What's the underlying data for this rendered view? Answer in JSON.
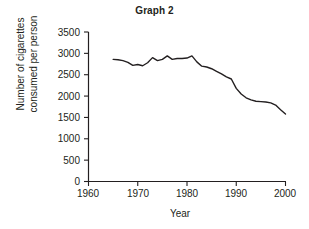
{
  "chart_data": {
    "type": "line",
    "title": "Graph 2",
    "xlabel": "Year",
    "ylabel": "Number of cigarettes consumed per person",
    "ylabel_lines": [
      "Number of cigarettes",
      "consumed per person"
    ],
    "xlim": [
      1960,
      2000
    ],
    "ylim": [
      0,
      3500
    ],
    "xticks": [
      1960,
      1970,
      1980,
      1990,
      2000
    ],
    "xtick_labels": [
      "1960",
      "1970",
      "1980",
      "1990",
      "2000"
    ],
    "yticks": [
      0,
      500,
      1000,
      1500,
      2000,
      2500,
      3000,
      3500
    ],
    "ytick_labels": [
      "0",
      "500",
      "1000",
      "1500",
      "2000",
      "2500",
      "3000",
      "3500"
    ],
    "grid": false,
    "legend": false,
    "line_color": "#231f20",
    "line_width": 1.4,
    "series": [
      {
        "name": "Cigarettes consumed per person",
        "x": [
          1965,
          1966,
          1967,
          1968,
          1969,
          1970,
          1971,
          1972,
          1973,
          1974,
          1975,
          1976,
          1977,
          1978,
          1979,
          1980,
          1981,
          1982,
          1983,
          1984,
          1985,
          1986,
          1987,
          1988,
          1989,
          1990,
          1991,
          1992,
          1993,
          1994,
          1995,
          1996,
          1997,
          1998,
          1999,
          2000
        ],
        "y": [
          2860,
          2850,
          2830,
          2790,
          2720,
          2740,
          2710,
          2780,
          2900,
          2830,
          2860,
          2940,
          2860,
          2880,
          2880,
          2890,
          2940,
          2800,
          2700,
          2680,
          2640,
          2580,
          2520,
          2450,
          2400,
          2180,
          2050,
          1960,
          1910,
          1880,
          1870,
          1860,
          1840,
          1790,
          1680,
          1580
        ]
      }
    ]
  }
}
